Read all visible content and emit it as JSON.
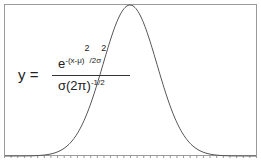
{
  "diagram": {
    "type": "gaussian-curve",
    "frame_color": "#999999",
    "curve_color": "#555555",
    "formula": {
      "lhs": "y =",
      "numerator_base": "e",
      "numerator_exp": "-(x-μ)",
      "numerator_exp_sq": "2",
      "numerator_exp_tail": "/2σ",
      "numerator_exp_tail_sq": "2",
      "denominator_base": "σ(2π)",
      "denominator_exp": "-1/2"
    },
    "x_axis": {
      "tick_count": 38,
      "labels_visible": false
    }
  }
}
